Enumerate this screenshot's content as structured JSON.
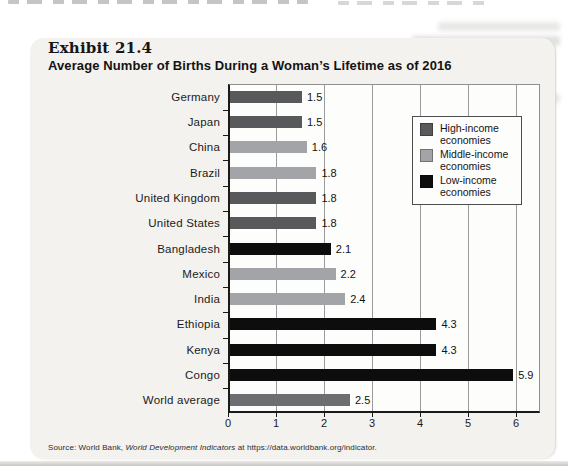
{
  "page": {
    "exhibit_label": "Exhibit 21.4",
    "exhibit_title": "Average Number of Births During a Woman’s Lifetime as of 2016",
    "source": {
      "prefix": "Source: World Bank, ",
      "work": "World Development Indicators",
      "suffix": " at https://data.worldbank.org/indicator."
    }
  },
  "colors": {
    "high": "#58595b",
    "middle": "#a2a4a7",
    "low": "#0d0d0d",
    "world": "#6d6e71",
    "card_bg": "#f3f2ef",
    "plot_bg": "#fdfdfc",
    "grid": "#9b9b9b",
    "axis": "#1a1a1a"
  },
  "legend": {
    "items": [
      {
        "group": "high",
        "line1": "High-income",
        "line2": "economies"
      },
      {
        "group": "middle",
        "line1": "Middle-income",
        "line2": "economies"
      },
      {
        "group": "low",
        "line1": "Low-income",
        "line2": "economies"
      }
    ]
  },
  "chart_data": {
    "type": "bar",
    "orientation": "horizontal",
    "title": "Average Number of Births During a Woman’s Lifetime as of 2016",
    "categories": [
      "Germany",
      "Japan",
      "China",
      "Brazil",
      "United Kingdom",
      "United States",
      "Bangladesh",
      "Mexico",
      "India",
      "Ethiopia",
      "Kenya",
      "Congo",
      "World average"
    ],
    "values": [
      1.5,
      1.5,
      1.6,
      1.8,
      1.8,
      1.8,
      2.1,
      2.2,
      2.4,
      4.3,
      4.3,
      5.9,
      2.5
    ],
    "groups": [
      "high",
      "high",
      "middle",
      "middle",
      "high",
      "high",
      "low",
      "middle",
      "middle",
      "low",
      "low",
      "low",
      "world"
    ],
    "xlabel": "",
    "ylabel": "",
    "xlim": [
      0,
      6.5
    ],
    "xticks": [
      0,
      1,
      2,
      3,
      4,
      5,
      6
    ],
    "grid": true,
    "value_labels": true,
    "legend_entries": [
      "High-income economies",
      "Middle-income economies",
      "Low-income economies"
    ],
    "legend_position": "upper right"
  }
}
